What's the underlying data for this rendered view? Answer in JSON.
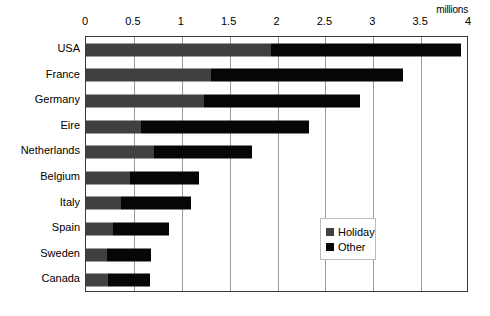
{
  "chart_data": {
    "type": "bar",
    "orientation": "horizontal",
    "stacked": true,
    "title": "",
    "xlabel": "millions",
    "ylabel": "",
    "xlim": [
      0,
      4
    ],
    "xticks": [
      0,
      0.5,
      1,
      1.5,
      2,
      2.5,
      3,
      3.5,
      4
    ],
    "xtick_labels": [
      "0",
      "0.5",
      "1",
      "1.5",
      "2",
      "2.5",
      "3",
      "3.5",
      "4"
    ],
    "grid": "vertical",
    "legend_position": "inside-bottom-right",
    "categories": [
      "USA",
      "France",
      "Germany",
      "Eire",
      "Netherlands",
      "Belgium",
      "Italy",
      "Spain",
      "Sweden",
      "Canada"
    ],
    "series": [
      {
        "name": "Holiday",
        "color": "#404040",
        "values": [
          1.93,
          1.31,
          1.23,
          0.57,
          0.71,
          0.46,
          0.37,
          0.28,
          0.22,
          0.23
        ]
      },
      {
        "name": "Other",
        "color": "#060606",
        "values": [
          1.99,
          2.0,
          1.63,
          1.76,
          1.02,
          0.72,
          0.73,
          0.59,
          0.46,
          0.44
        ]
      }
    ],
    "totals": [
      3.92,
      3.31,
      2.86,
      2.33,
      1.73,
      1.18,
      1.1,
      0.87,
      0.68,
      0.67
    ]
  },
  "axis": {
    "unit_label": "millions"
  },
  "legend": {
    "items": [
      {
        "label": "Holiday",
        "color": "#404040"
      },
      {
        "label": "Other",
        "color": "#060606"
      }
    ]
  }
}
